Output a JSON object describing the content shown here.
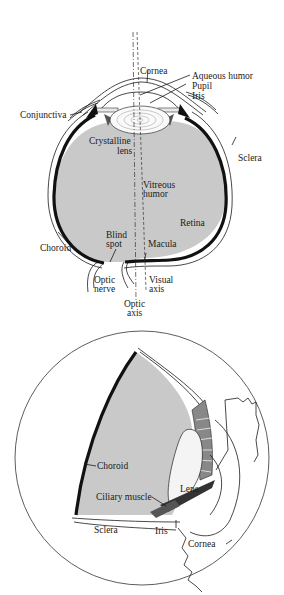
{
  "figure_top": {
    "title": "Horizontal cross-section of the human eye",
    "labels": {
      "cornea": "Cornea",
      "aqueous_humor": "Aqueous humor",
      "pupil": "Pupil",
      "iris": "Iris",
      "conjunctiva": "Conjunctiva",
      "crystalline_lens_1": "Crystalline",
      "crystalline_lens_2": "lens",
      "sclera": "Sclera",
      "vitreous_humor_1": "Vitreous",
      "vitreous_humor_2": "humor",
      "retina": "Retina",
      "choroid": "Choroid",
      "blind_spot_1": "Blind",
      "blind_spot_2": "spot",
      "macula": "Macula",
      "optic_nerve_1": "Optic",
      "optic_nerve_2": "nerve",
      "visual_axis_1": "Visual",
      "visual_axis_2": "axis",
      "optic_axis_1": "Optic",
      "optic_axis_2": "axis"
    }
  },
  "figure_bottom": {
    "title": "Cutaway view of the eyeball",
    "labels": {
      "choroid": "Choroid",
      "ciliary_muscle": "Ciliary muscle",
      "lens": "Lens",
      "sclera": "Sclera",
      "iris": "Iris",
      "cornea": "Cornea"
    }
  },
  "colors": {
    "background": "#ffffff",
    "vitreous_fill": "#c9c9c9",
    "ink": "#1a1a1a"
  }
}
